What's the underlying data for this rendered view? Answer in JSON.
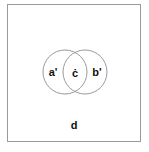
{
  "diagram": {
    "type": "venn",
    "universe_label": "d",
    "sets": [
      {
        "name": "left-circle",
        "label": "a'"
      },
      {
        "name": "right-circle",
        "label": "b'"
      }
    ],
    "intersection_label": "ċ",
    "colors": {
      "stroke": "#9a9a9a",
      "text": "#111111",
      "background": "#ffffff"
    }
  }
}
